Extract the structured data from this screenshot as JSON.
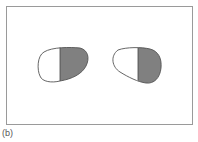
{
  "figure": {
    "caption": "(b)",
    "colors": {
      "frame": "#9a9a9a",
      "outline": "#555555",
      "shaded": "#808080",
      "clear": "#ffffff"
    },
    "lenses": [
      {
        "name": "left-lens",
        "shaded_side": "right"
      },
      {
        "name": "right-lens",
        "shaded_side": "right"
      }
    ]
  }
}
